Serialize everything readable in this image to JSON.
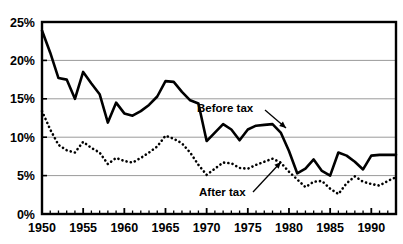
{
  "chart_data": {
    "type": "line",
    "title": "",
    "subtitle": "",
    "xlabel": "",
    "ylabel": "",
    "xlim": [
      1950,
      1993
    ],
    "ylim": [
      0,
      25
    ],
    "y_ticks": [
      0,
      5,
      10,
      15,
      20,
      25
    ],
    "y_tick_labels": [
      "0%",
      "5%",
      "10%",
      "15%",
      "20%",
      "25%"
    ],
    "x_ticks": [
      1950,
      1955,
      1960,
      1965,
      1970,
      1975,
      1980,
      1985,
      1990
    ],
    "x_tick_labels": [
      "1950",
      "1955",
      "1960",
      "1965",
      "1970",
      "1975",
      "1980",
      "1985",
      "1990"
    ],
    "x_minor_tick_step": 1,
    "grid": true,
    "grid_axis": "y",
    "grid_color": "#9a9a9a",
    "legend": "annotations",
    "legend_position": "inline-annotations",
    "x": [
      1950,
      1951,
      1952,
      1953,
      1954,
      1955,
      1956,
      1957,
      1958,
      1959,
      1960,
      1961,
      1962,
      1963,
      1964,
      1965,
      1966,
      1967,
      1968,
      1969,
      1970,
      1971,
      1972,
      1973,
      1974,
      1975,
      1976,
      1977,
      1978,
      1979,
      1980,
      1981,
      1982,
      1983,
      1984,
      1985,
      1986,
      1987,
      1988,
      1989,
      1990,
      1991,
      1992,
      1993
    ],
    "series": [
      {
        "name": "Before tax",
        "style": "solid",
        "color": "#000000",
        "line_width": 2.6,
        "values": [
          23.9,
          21.0,
          17.7,
          17.5,
          15.0,
          18.5,
          17.0,
          15.6,
          11.9,
          14.5,
          13.1,
          12.8,
          13.4,
          14.2,
          15.3,
          17.3,
          17.2,
          15.9,
          14.8,
          14.4,
          9.5,
          10.6,
          11.7,
          11.0,
          9.6,
          11.0,
          11.5,
          11.6,
          11.7,
          10.6,
          8.2,
          5.3,
          5.9,
          7.1,
          5.6,
          5.0,
          8.0,
          7.6,
          6.8,
          5.8,
          7.6,
          7.7,
          7.7,
          7.7
        ]
      },
      {
        "name": "After tax",
        "style": "dotted",
        "color": "#000000",
        "line_width": 2.6,
        "values": [
          13.4,
          11.0,
          9.0,
          8.3,
          8.0,
          9.4,
          8.6,
          8.0,
          6.5,
          7.3,
          6.9,
          6.7,
          7.3,
          8.0,
          8.8,
          10.2,
          9.8,
          9.2,
          8.0,
          6.4,
          5.1,
          5.9,
          6.7,
          6.6,
          6.0,
          5.9,
          6.4,
          6.8,
          7.2,
          6.7,
          5.5,
          4.5,
          3.5,
          4.2,
          4.3,
          3.3,
          2.6,
          4.0,
          4.9,
          4.2,
          3.9,
          3.7,
          4.3,
          4.8
        ]
      }
    ],
    "annotations": [
      {
        "name": "before-tax-label",
        "text": "Before tax",
        "x_text": 197,
        "y_text": 112,
        "leader": {
          "x1": 265,
          "y1": 110,
          "x2": 286,
          "y2": 128
        }
      },
      {
        "name": "after-tax-label",
        "text": "After tax",
        "x_text": 199,
        "y_text": 196,
        "leader": {
          "x1": 253,
          "y1": 192,
          "x2": 281,
          "y2": 162
        }
      }
    ]
  },
  "colors": {
    "background": "#ffffff",
    "axis": "#000000",
    "grid": "#9a9a9a",
    "ink": "#000000"
  }
}
